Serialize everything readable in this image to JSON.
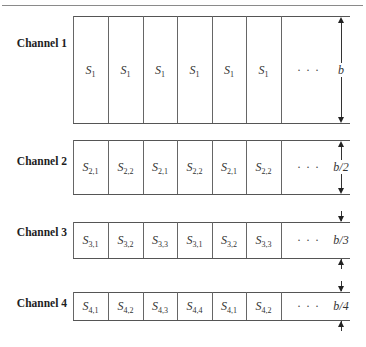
{
  "figure": {
    "ellipsis": "· · ·"
  },
  "channels": [
    {
      "label": "Channel 1",
      "slots": [
        {
          "base": "S",
          "sub": "1"
        },
        {
          "base": "S",
          "sub": "1"
        },
        {
          "base": "S",
          "sub": "1"
        },
        {
          "base": "S",
          "sub": "1"
        },
        {
          "base": "S",
          "sub": "1"
        },
        {
          "base": "S",
          "sub": "1"
        }
      ],
      "dimension": "b"
    },
    {
      "label": "Channel 2",
      "slots": [
        {
          "base": "S",
          "sub": "2,1"
        },
        {
          "base": "S",
          "sub": "2,2"
        },
        {
          "base": "S",
          "sub": "2,1"
        },
        {
          "base": "S",
          "sub": "2,2"
        },
        {
          "base": "S",
          "sub": "2,1"
        },
        {
          "base": "S",
          "sub": "2,2"
        }
      ],
      "dimension": "b/2"
    },
    {
      "label": "Channel 3",
      "slots": [
        {
          "base": "S",
          "sub": "3,1"
        },
        {
          "base": "S",
          "sub": "3,2"
        },
        {
          "base": "S",
          "sub": "3,3"
        },
        {
          "base": "S",
          "sub": "3,1"
        },
        {
          "base": "S",
          "sub": "3,2"
        },
        {
          "base": "S",
          "sub": "3,3"
        }
      ],
      "dimension": "b/3"
    },
    {
      "label": "Channel 4",
      "slots": [
        {
          "base": "S",
          "sub": "4,1"
        },
        {
          "base": "S",
          "sub": "4,2"
        },
        {
          "base": "S",
          "sub": "4,3"
        },
        {
          "base": "S",
          "sub": "4,4"
        },
        {
          "base": "S",
          "sub": "4,1"
        },
        {
          "base": "S",
          "sub": "4,2"
        }
      ],
      "dimension": "b/4"
    }
  ]
}
